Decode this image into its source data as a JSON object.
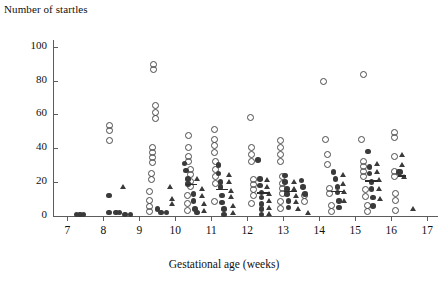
{
  "chart": {
    "y_axis_title": "Number of startles",
    "x_axis_title": "Gestational age (weeks)"
  },
  "chart_data": {
    "type": "scatter",
    "title": "",
    "xlabel": "Gestational age (weeks)",
    "ylabel": "Number of startles",
    "xlim": [
      6.6,
      17.3
    ],
    "ylim": [
      0,
      104
    ],
    "xticks": [
      7,
      8,
      9,
      10,
      11,
      12,
      13,
      14,
      15,
      16,
      17
    ],
    "yticks": [
      0,
      20,
      40,
      60,
      80,
      100
    ],
    "grid": false,
    "legend": "none",
    "marker_types": [
      "open-circle",
      "filled-circle",
      "filled-triangle"
    ],
    "series": [
      {
        "name": "open-circle",
        "marker": "open-circle",
        "points": [
          [
            8.15,
            54
          ],
          [
            8.15,
            51
          ],
          [
            8.15,
            45
          ],
          [
            9.37,
            90
          ],
          [
            9.37,
            87
          ],
          [
            9.42,
            66
          ],
          [
            9.42,
            62
          ],
          [
            9.42,
            58
          ],
          [
            9.35,
            41
          ],
          [
            9.35,
            38
          ],
          [
            9.35,
            35
          ],
          [
            9.35,
            32
          ],
          [
            9.3,
            26
          ],
          [
            9.3,
            22
          ],
          [
            9.25,
            15
          ],
          [
            9.25,
            10
          ],
          [
            9.25,
            6
          ],
          [
            9.25,
            3
          ],
          [
            10.35,
            48
          ],
          [
            10.35,
            41
          ],
          [
            10.35,
            36
          ],
          [
            10.35,
            33
          ],
          [
            10.4,
            28
          ],
          [
            10.4,
            25
          ],
          [
            10.4,
            21
          ],
          [
            10.4,
            18
          ],
          [
            10.3,
            13
          ],
          [
            10.3,
            8
          ],
          [
            10.3,
            4
          ],
          [
            11.05,
            52
          ],
          [
            11.05,
            46
          ],
          [
            11.05,
            42
          ],
          [
            11.05,
            38
          ],
          [
            11.1,
            33
          ],
          [
            11.1,
            28
          ],
          [
            11.1,
            24
          ],
          [
            11.1,
            20
          ],
          [
            11.05,
            9
          ],
          [
            12.05,
            59
          ],
          [
            12.1,
            41
          ],
          [
            12.1,
            37
          ],
          [
            12.1,
            33
          ],
          [
            12.15,
            22
          ],
          [
            12.15,
            19
          ],
          [
            12.15,
            16
          ],
          [
            12.15,
            13
          ],
          [
            12.1,
            8
          ],
          [
            12.9,
            45
          ],
          [
            12.9,
            41
          ],
          [
            12.9,
            37
          ],
          [
            12.9,
            33
          ],
          [
            12.95,
            24
          ],
          [
            12.95,
            20
          ],
          [
            12.95,
            17
          ],
          [
            12.95,
            14
          ],
          [
            12.9,
            9
          ],
          [
            12.9,
            5
          ],
          [
            13.55,
            13
          ],
          [
            13.55,
            9
          ],
          [
            14.1,
            80
          ],
          [
            14.15,
            46
          ],
          [
            14.2,
            37
          ],
          [
            14.2,
            31
          ],
          [
            14.25,
            17
          ],
          [
            14.25,
            14
          ],
          [
            14.3,
            7
          ],
          [
            14.3,
            3
          ],
          [
            15.2,
            84
          ],
          [
            15.15,
            46
          ],
          [
            15.2,
            33
          ],
          [
            15.2,
            30
          ],
          [
            15.2,
            27
          ],
          [
            15.2,
            24
          ],
          [
            15.25,
            16
          ],
          [
            15.25,
            12
          ],
          [
            15.3,
            7
          ],
          [
            15.3,
            3
          ],
          [
            16.05,
            50
          ],
          [
            16.05,
            47
          ],
          [
            16.05,
            36
          ],
          [
            16.05,
            27
          ],
          [
            16.05,
            24
          ],
          [
            16.1,
            14
          ],
          [
            16.1,
            10
          ],
          [
            16.1,
            4
          ]
        ]
      },
      {
        "name": "filled-circle",
        "marker": "filled-circle",
        "points": [
          [
            7.25,
            1
          ],
          [
            7.35,
            1
          ],
          [
            7.45,
            1
          ],
          [
            8.15,
            12
          ],
          [
            8.15,
            2
          ],
          [
            8.35,
            2
          ],
          [
            8.45,
            2
          ],
          [
            8.6,
            1
          ],
          [
            8.75,
            1
          ],
          [
            9.5,
            4
          ],
          [
            9.6,
            2
          ],
          [
            9.75,
            2
          ],
          [
            10.25,
            31
          ],
          [
            10.3,
            27
          ],
          [
            10.35,
            22
          ],
          [
            10.35,
            19
          ],
          [
            10.5,
            13
          ],
          [
            10.5,
            9
          ],
          [
            10.55,
            4
          ],
          [
            10.6,
            2
          ],
          [
            11.2,
            30
          ],
          [
            11.2,
            25
          ],
          [
            11.25,
            20
          ],
          [
            11.25,
            17
          ],
          [
            11.3,
            12
          ],
          [
            11.3,
            8
          ],
          [
            11.35,
            4
          ],
          [
            11.35,
            1
          ],
          [
            12.3,
            33
          ],
          [
            12.35,
            22
          ],
          [
            12.35,
            18
          ],
          [
            12.4,
            14
          ],
          [
            12.4,
            11
          ],
          [
            12.4,
            7
          ],
          [
            12.4,
            4
          ],
          [
            12.4,
            1
          ],
          [
            13.05,
            24
          ],
          [
            13.05,
            20
          ],
          [
            13.1,
            16
          ],
          [
            13.1,
            13
          ],
          [
            13.15,
            9
          ],
          [
            13.15,
            5
          ],
          [
            13.5,
            21
          ],
          [
            13.55,
            17
          ],
          [
            13.6,
            13
          ],
          [
            14.4,
            26
          ],
          [
            14.45,
            22
          ],
          [
            14.5,
            17
          ],
          [
            14.5,
            14
          ],
          [
            14.55,
            9
          ],
          [
            14.55,
            5
          ],
          [
            15.35,
            38
          ],
          [
            15.4,
            29
          ],
          [
            15.4,
            25
          ],
          [
            15.45,
            20
          ],
          [
            15.45,
            16
          ],
          [
            15.5,
            11
          ],
          [
            15.5,
            6
          ],
          [
            16.2,
            26
          ],
          [
            16.25,
            26
          ]
        ]
      },
      {
        "name": "filled-triangle",
        "marker": "filled-triangle",
        "points": [
          [
            8.55,
            17
          ],
          [
            9.85,
            17
          ],
          [
            9.9,
            10
          ],
          [
            9.9,
            7
          ],
          [
            10.6,
            22
          ],
          [
            10.75,
            16
          ],
          [
            10.75,
            12
          ],
          [
            10.8,
            7
          ],
          [
            10.8,
            3
          ],
          [
            11.5,
            24
          ],
          [
            11.5,
            20
          ],
          [
            11.55,
            15
          ],
          [
            11.55,
            11
          ],
          [
            11.6,
            6
          ],
          [
            11.6,
            2
          ],
          [
            12.55,
            21
          ],
          [
            12.55,
            17
          ],
          [
            12.6,
            13
          ],
          [
            12.6,
            9
          ],
          [
            12.6,
            5
          ],
          [
            12.6,
            1
          ],
          [
            13.3,
            20
          ],
          [
            13.3,
            16
          ],
          [
            13.35,
            12
          ],
          [
            13.35,
            8
          ],
          [
            13.4,
            4
          ],
          [
            13.7,
            2
          ],
          [
            14.65,
            24
          ],
          [
            14.65,
            19
          ],
          [
            14.7,
            14
          ],
          [
            14.7,
            9
          ],
          [
            15.6,
            31
          ],
          [
            15.6,
            26
          ],
          [
            15.65,
            21
          ],
          [
            15.65,
            16
          ],
          [
            15.7,
            10
          ],
          [
            16.3,
            36
          ],
          [
            16.3,
            30
          ],
          [
            16.35,
            23
          ],
          [
            16.6,
            4
          ]
        ]
      }
    ],
    "median_bars": [
      {
        "x": 10.45,
        "y": 19,
        "width": 0.3
      },
      {
        "x": 11.3,
        "y": 16,
        "width": 0.32
      },
      {
        "x": 12.45,
        "y": 14,
        "width": 0.34
      },
      {
        "x": 13.2,
        "y": 15,
        "width": 0.34
      },
      {
        "x": 14.5,
        "y": 15,
        "width": 0.36
      },
      {
        "x": 15.45,
        "y": 21,
        "width": 0.36
      },
      {
        "x": 16.3,
        "y": 24,
        "width": 0.24
      }
    ]
  }
}
